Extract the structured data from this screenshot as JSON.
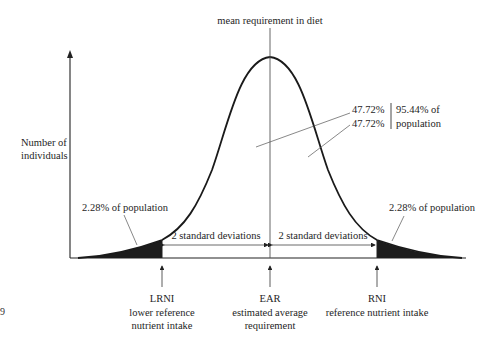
{
  "diagram": {
    "title_label": "mean requirement in diet",
    "y_axis_label_line1": "Number of",
    "y_axis_label_line2": "individuals",
    "left_tail_label": "2.28% of population",
    "right_tail_label": "2.28% of population",
    "center_pct_upper": "47.72%",
    "center_pct_lower": "47.72%",
    "center_total_line1": "95.44% of",
    "center_total_line2": "population",
    "sd_left_label": "2 standard deviations",
    "sd_right_label": "2 standard deviations",
    "markers": [
      {
        "abbr": "LRNI",
        "desc_line1": "lower reference",
        "desc_line2": "nutrient intake"
      },
      {
        "abbr": "EAR",
        "desc_line1": "estimated average",
        "desc_line2": "requirement"
      },
      {
        "abbr": "RNI",
        "desc_line1": "reference nutrient intake",
        "desc_line2": ""
      }
    ],
    "page_mark": "9",
    "colors": {
      "line": "#1a1a1a",
      "fill": "#1c1c1c",
      "thin": "#555555"
    }
  }
}
